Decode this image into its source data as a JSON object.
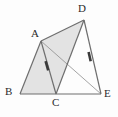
{
  "figure": {
    "kind": "geometry-diagram",
    "width": 118,
    "height": 117,
    "background_color": "#fdfdfd",
    "stroke_color": "#6e6e6e",
    "thin_stroke_color": "#8d8d8d",
    "shade_color": "#e3e3e3",
    "label_color": "#2b2b2b",
    "points": {
      "A": {
        "label": "A",
        "x": 41,
        "y": 41,
        "label_x": 31,
        "label_y": 28
      },
      "B": {
        "label": "B",
        "x": 20,
        "y": 94,
        "label_x": 5,
        "label_y": 86
      },
      "C": {
        "label": "C",
        "x": 56,
        "y": 94,
        "label_x": 52,
        "label_y": 97
      },
      "D": {
        "label": "D",
        "x": 84,
        "y": 20,
        "label_x": 78,
        "label_y": 3
      },
      "E": {
        "label": "E",
        "x": 101,
        "y": 94,
        "label_x": 104,
        "label_y": 88
      }
    },
    "shaded_regions": [
      {
        "name": "triangle-abc",
        "polygon": "20,94 41,41 56,94"
      },
      {
        "name": "triangle-acd",
        "polygon": "41,41 84,20 56,94"
      }
    ],
    "segments": [
      {
        "name": "segment-bc",
        "x1": 20,
        "y1": 94,
        "x2": 56,
        "y2": 94,
        "weight": "normal"
      },
      {
        "name": "segment-ce",
        "x1": 56,
        "y1": 94,
        "x2": 101,
        "y2": 94,
        "weight": "normal"
      },
      {
        "name": "segment-ab",
        "x1": 41,
        "y1": 41,
        "x2": 20,
        "y2": 94,
        "weight": "normal"
      },
      {
        "name": "segment-ac",
        "x1": 41,
        "y1": 41,
        "x2": 56,
        "y2": 94,
        "weight": "normal"
      },
      {
        "name": "segment-ad",
        "x1": 41,
        "y1": 41,
        "x2": 84,
        "y2": 20,
        "weight": "normal"
      },
      {
        "name": "segment-de",
        "x1": 84,
        "y1": 20,
        "x2": 101,
        "y2": 94,
        "weight": "normal"
      },
      {
        "name": "segment-cd",
        "x1": 56,
        "y1": 94,
        "x2": 84,
        "y2": 20,
        "weight": "normal"
      },
      {
        "name": "segment-ae",
        "x1": 41,
        "y1": 41,
        "x2": 101,
        "y2": 94,
        "weight": "thin"
      }
    ],
    "tick_marks": [
      {
        "name": "tick-on-ac",
        "x1": 45.6,
        "y1": 61.2,
        "x2": 48.2,
        "y2": 70.4
      },
      {
        "name": "tick-on-de",
        "x1": 88.6,
        "y1": 52.0,
        "x2": 90.7,
        "y2": 61.2
      }
    ]
  }
}
